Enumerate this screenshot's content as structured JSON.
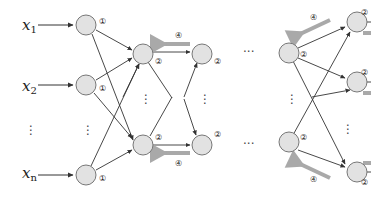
{
  "diagram": {
    "type": "neural-network-backprop",
    "inputs": [
      {
        "base": "x",
        "sub": "1"
      },
      {
        "base": "x",
        "sub": "2"
      },
      {
        "base": "⋮",
        "sub": ""
      },
      {
        "base": "x",
        "sub": "n"
      }
    ],
    "step_labels": {
      "input_layer": "①",
      "hidden_layer": "②",
      "backprop": "④"
    },
    "ellipsis_horizontal": "···",
    "ellipsis_vertical": "⋮",
    "colors": {
      "node_fill": "#e2e2e2",
      "node_stroke": "#777777",
      "edge": "#333333",
      "backprop_arrow": "#a9a9a9"
    }
  }
}
